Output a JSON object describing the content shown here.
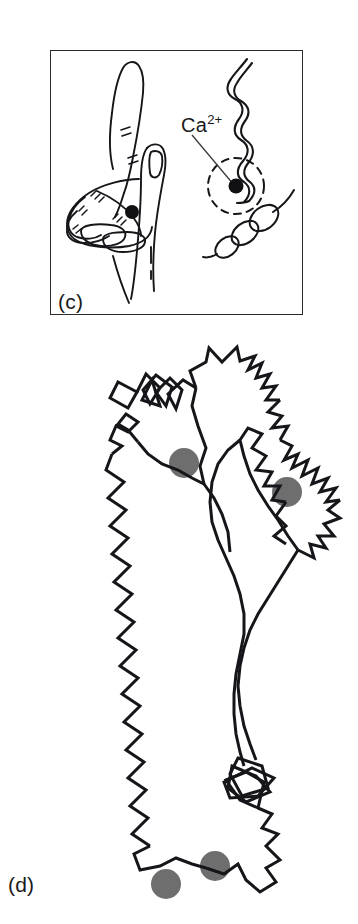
{
  "figure": {
    "background_color": "#ffffff",
    "ink_color": "#16161a",
    "calcium_ion_color_panel_c": "#111114",
    "calcium_ion_color_panel_d": "#6e6e6e",
    "width": 358,
    "height": 924
  },
  "panel_c": {
    "label": "(c)",
    "has_border": true,
    "border_color": "#2b2b2b",
    "ion_label": {
      "element": "Ca",
      "charge": "2+",
      "full_text": "Ca2+"
    },
    "annotations": {
      "leader_line": "line from Ca2+ label to bound ion",
      "binding_loop": "dashed circle",
      "hand_ions": 1,
      "ribbon_ions": 1
    }
  },
  "panel_d": {
    "label": "(d)",
    "has_border": false,
    "calcium_ion_count": 4,
    "ion_radius": 15,
    "ions": [
      {
        "cx": 184,
        "cy": 463,
        "r": 15
      },
      {
        "cx": 287,
        "cy": 492,
        "r": 15
      },
      {
        "cx": 215,
        "cy": 866,
        "r": 15
      },
      {
        "cx": 166,
        "cy": 884,
        "r": 15
      }
    ]
  }
}
